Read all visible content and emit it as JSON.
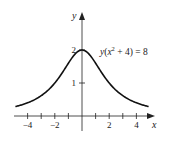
{
  "chart_data": {
    "type": "line",
    "title": "",
    "equation_label": "y(x² + 4) = 8",
    "xlabel": "x",
    "ylabel": "y",
    "x_tick_labels": [
      "−4",
      "−2",
      "2",
      "4"
    ],
    "x_tick_values": [
      -4,
      -3,
      -2,
      -1,
      1,
      2,
      3,
      4
    ],
    "y_tick_labels": [
      "1",
      "2"
    ],
    "y_tick_values": [
      1,
      2
    ],
    "xlim": [
      -4.5,
      4.5
    ],
    "ylim": [
      0,
      2.6
    ],
    "grid": false,
    "series": [
      {
        "name": "y = 8/(x^2+4)",
        "x": [
          -4.5,
          -4,
          -3,
          -2,
          -1,
          0,
          1,
          2,
          3,
          4,
          4.5
        ],
        "y": [
          0.33,
          0.4,
          0.62,
          1.0,
          1.6,
          2.0,
          1.6,
          1.0,
          0.62,
          0.4,
          0.33
        ]
      }
    ]
  }
}
